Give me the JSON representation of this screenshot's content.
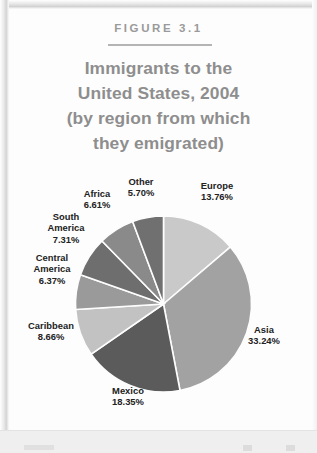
{
  "figure": {
    "label": "FIGURE 3.1",
    "title_lines": [
      "Immigrants to the",
      "United States, 2004",
      "(by region from which",
      "they emigrated)"
    ],
    "title_color": "#8e8e8e",
    "label_color": "#9a9a9a"
  },
  "chart_data": {
    "type": "pie",
    "title": "Immigrants to the United States, 2004 (by region from which they emigrated)",
    "unit": "percent",
    "legend": "none",
    "labels_inline": true,
    "start_angle_deg": 0,
    "direction": "clockwise",
    "categories": [
      "Europe",
      "Asia",
      "Mexico",
      "Caribbean",
      "Central America",
      "South America",
      "Africa",
      "Other"
    ],
    "values": [
      13.76,
      33.24,
      18.35,
      8.66,
      6.37,
      7.31,
      6.61,
      5.7
    ],
    "slices": [
      {
        "name": "Europe",
        "label": "Europe",
        "value": 13.76,
        "value_text": "13.76%",
        "color": "#c9c9c9"
      },
      {
        "name": "Asia",
        "label": "Asia",
        "value": 33.24,
        "value_text": "33.24%",
        "color": "#a2a2a2"
      },
      {
        "name": "Mexico",
        "label": "Mexico",
        "value": 18.35,
        "value_text": "18.35%",
        "color": "#5b5b5b"
      },
      {
        "name": "Caribbean",
        "label": "Caribbean",
        "value": 8.66,
        "value_text": "8.66%",
        "color": "#c2c2c2"
      },
      {
        "name": "Central America",
        "label": "Central\nAmerica",
        "value": 6.37,
        "value_text": "6.37%",
        "color": "#9a9a9a"
      },
      {
        "name": "South America",
        "label": "South\nAmerica",
        "value": 7.31,
        "value_text": "7.31%",
        "color": "#6e6e6e"
      },
      {
        "name": "Africa",
        "label": "Africa",
        "value": 6.61,
        "value_text": "6.61%",
        "color": "#8a8a8a"
      },
      {
        "name": "Other",
        "label": "Other",
        "value": 5.7,
        "value_text": "5.70%",
        "color": "#707070"
      }
    ],
    "label_texts": {
      "other": "Other\n5.70%",
      "europe": "Europe\n13.76%",
      "africa": "Africa\n6.61%",
      "south_america": "South\nAmerica\n7.31%",
      "central_america": "Central\nAmerica\n6.37%",
      "caribbean": "Caribbean\n8.66%",
      "mexico": "Mexico\n18.35%",
      "asia": "Asia\n33.24%"
    }
  }
}
